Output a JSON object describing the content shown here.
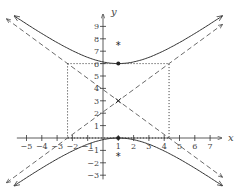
{
  "chart_data": {
    "type": "line",
    "title": "",
    "xlabel": "x",
    "ylabel": "y",
    "xlim": [
      -5.5,
      7.5
    ],
    "ylim": [
      -3.5,
      9.5
    ],
    "x_ticks": [
      -5,
      -4,
      -3,
      -2,
      -1,
      1,
      2,
      3,
      4,
      5,
      6,
      7
    ],
    "y_ticks": [
      -3,
      -2,
      -1,
      1,
      2,
      3,
      4,
      5,
      6,
      7,
      8,
      9
    ],
    "grid": false,
    "hyperbola": {
      "equation": "(y-3)^2/9 - (x-1)^2/11 = 1",
      "center": [
        1,
        3
      ],
      "a": 3,
      "b_squared": 11,
      "vertices": [
        [
          1,
          6
        ],
        [
          1,
          0
        ]
      ],
      "foci": [
        [
          1,
          7.47
        ],
        [
          1,
          -1.47
        ]
      ]
    },
    "asymptotes": [
      {
        "name": "asymptote-1",
        "slope": 0.9045,
        "point": [
          1,
          3
        ],
        "style": "dashed"
      },
      {
        "name": "asymptote-2",
        "slope": -0.9045,
        "point": [
          1,
          3
        ],
        "style": "dashed"
      }
    ],
    "guide_box": {
      "x": [
        -2.317,
        4.317
      ],
      "y": [
        0,
        6
      ],
      "style": "dotted"
    },
    "markers": [
      {
        "name": "vertex-top",
        "x": 1,
        "y": 6,
        "symbol": "dot"
      },
      {
        "name": "vertex-bottom",
        "x": 1,
        "y": 0,
        "symbol": "dot"
      },
      {
        "name": "center",
        "x": 1,
        "y": 3,
        "symbol": "cross"
      },
      {
        "name": "focus-top",
        "x": 1,
        "y": 7.47,
        "symbol": "asterisk"
      },
      {
        "name": "focus-bottom",
        "x": 1,
        "y": -1.47,
        "symbol": "asterisk"
      }
    ],
    "colors": {
      "curve": "#333333",
      "axis": "#333333",
      "dashed": "#444444"
    }
  }
}
